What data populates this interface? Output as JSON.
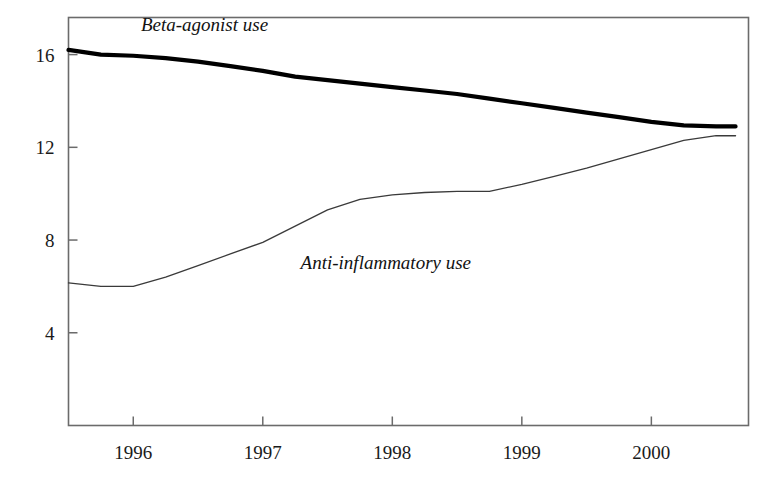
{
  "chart_data": {
    "type": "line",
    "title": "",
    "subtitle": "",
    "xlabel": "",
    "ylabel": "",
    "grid": false,
    "legend_position": "inline-annotations",
    "xlim": [
      1995.5,
      2000.75
    ],
    "ylim": [
      0,
      17.6
    ],
    "x_ticks": [
      1996,
      1997,
      1998,
      1999,
      2000
    ],
    "x_tick_labels": [
      "1996",
      "1997",
      "1998",
      "1999",
      "2000"
    ],
    "y_ticks": [
      4,
      8,
      12,
      16
    ],
    "y_tick_labels": [
      "4",
      "8",
      "12",
      "16"
    ],
    "series": [
      {
        "name": "Beta-agonist use",
        "label": "Beta-agonist use",
        "color": "#000000",
        "line_width": 4.2,
        "x": [
          1995.5,
          1995.75,
          1996.0,
          1996.25,
          1996.5,
          1996.75,
          1997.0,
          1997.25,
          1997.5,
          1997.75,
          1998.0,
          1998.25,
          1998.5,
          1998.75,
          1999.0,
          1999.25,
          1999.5,
          1999.75,
          2000.0,
          2000.25,
          2000.5,
          2000.65
        ],
        "y": [
          16.2,
          16.0,
          15.95,
          15.85,
          15.7,
          15.5,
          15.3,
          15.05,
          14.9,
          14.75,
          14.6,
          14.45,
          14.3,
          14.1,
          13.9,
          13.7,
          13.5,
          13.3,
          13.1,
          12.95,
          12.9,
          12.9
        ]
      },
      {
        "name": "Anti-inflammatory use",
        "label": "Anti-inflammatory use",
        "color": "#3a3a3a",
        "line_width": 1.3,
        "x": [
          1995.5,
          1995.75,
          1996.0,
          1996.25,
          1996.5,
          1996.75,
          1997.0,
          1997.25,
          1997.5,
          1997.75,
          1998.0,
          1998.25,
          1998.5,
          1998.75,
          1999.0,
          1999.25,
          1999.5,
          1999.75,
          2000.0,
          2000.25,
          2000.5,
          2000.65
        ],
        "y": [
          6.15,
          6.0,
          6.0,
          6.4,
          6.9,
          7.4,
          7.9,
          8.6,
          9.3,
          9.75,
          9.95,
          10.05,
          10.1,
          10.1,
          10.4,
          10.75,
          11.1,
          11.5,
          11.9,
          12.3,
          12.5,
          12.5
        ]
      }
    ],
    "annotations": [
      {
        "text": "Beta-agonist use",
        "x": 1996.55,
        "y": 17.0
      },
      {
        "text": "Anti-inflammatory use",
        "x": 1997.95,
        "y": 6.75
      }
    ]
  },
  "axis": {
    "frame_color": "#6b6b6b",
    "tick_color": "#6b6b6b"
  }
}
